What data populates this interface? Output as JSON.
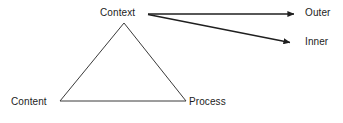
{
  "diagram": {
    "background_color": "#ffffff",
    "stroke_color": "#2b2b2b",
    "text_color": "#1c1c1c",
    "nodes": [
      {
        "id": "context",
        "label": "Context",
        "x": 124,
        "y": 14
      },
      {
        "id": "content",
        "label": "Content",
        "x": 34,
        "y": 102
      },
      {
        "id": "process",
        "label": "Process",
        "x": 211,
        "y": 102
      },
      {
        "id": "outer",
        "label": "Outer",
        "x": 317,
        "y": 13
      },
      {
        "id": "inner",
        "label": "Inner",
        "x": 317,
        "y": 42
      }
    ],
    "triangle": {
      "apex": {
        "x": 124,
        "y": 23
      },
      "bottom_left": {
        "x": 60,
        "y": 101
      },
      "bottom_right": {
        "x": 186,
        "y": 101
      }
    },
    "arrows": [
      {
        "id": "context-to-outer",
        "from": "context",
        "to": "outer",
        "start": {
          "x": 148,
          "y": 14
        },
        "end": {
          "x": 299,
          "y": 14
        },
        "head": "filled-triangle"
      },
      {
        "id": "context-to-inner",
        "from": "context",
        "to": "inner",
        "start": {
          "x": 148,
          "y": 14
        },
        "end": {
          "x": 295,
          "y": 43
        },
        "head": "filled-triangle"
      }
    ]
  }
}
